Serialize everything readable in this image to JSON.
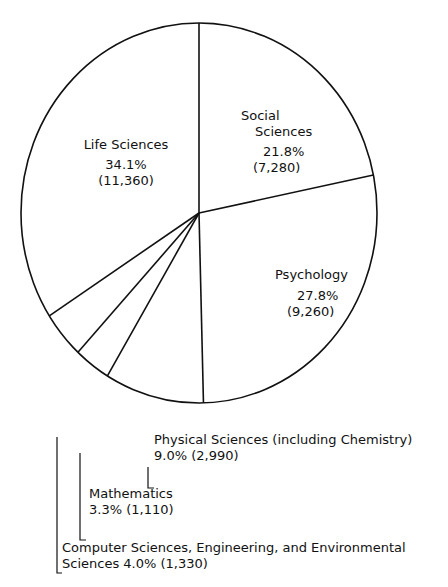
{
  "chart_data": {
    "type": "pie",
    "title": "",
    "slices": [
      {
        "label": "Social Sciences",
        "percent": 21.8,
        "value": 7280
      },
      {
        "label": "Psychology",
        "percent": 27.8,
        "value": 9260
      },
      {
        "label": "Physical Sciences (including Chemistry)",
        "percent": 9.0,
        "value": 2990
      },
      {
        "label": "Mathematics",
        "percent": 3.3,
        "value": 1110
      },
      {
        "label": "Computer Sciences, Engineering, and Environmental Sciences",
        "percent": 4.0,
        "value": 1330
      },
      {
        "label": "Life Sciences",
        "percent": 34.1,
        "value": 11360
      }
    ]
  },
  "labels": {
    "social_1": "Social",
    "social_2": "Sciences",
    "social_pct": "21.8%",
    "social_val": "(7,280)",
    "psych_1": "Psychology",
    "psych_pct": "27.8%",
    "psych_val": "(9,260)",
    "life_1": "Life Sciences",
    "life_pct": "34.1%",
    "life_val": "(11,360)",
    "phys_1": "Physical Sciences (including Chemistry)",
    "phys_2": "9.0% (2,990)",
    "math_1": "Mathematics",
    "math_2": "3.3% (1,110)",
    "comp_1": "Computer Sciences, Engineering, and Environmental",
    "comp_2": "Sciences 4.0% (1,330)"
  }
}
